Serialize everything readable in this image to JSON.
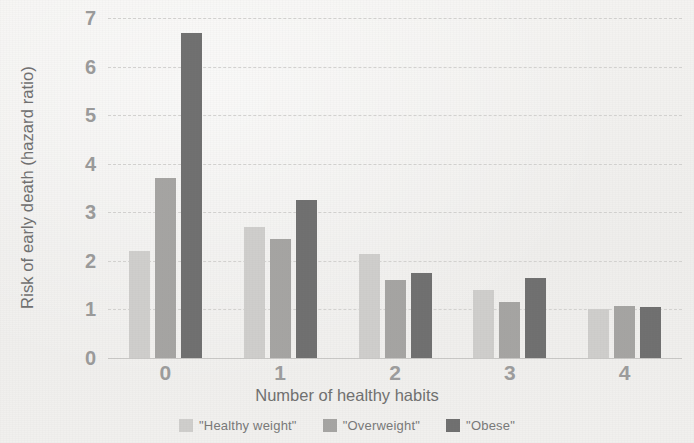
{
  "chart_data": {
    "type": "bar",
    "title": "",
    "xlabel": "Number of healthy habits",
    "ylabel": "Risk of early death (hazard ratio)",
    "categories": [
      "0",
      "1",
      "2",
      "3",
      "4"
    ],
    "series": [
      {
        "name": "\"Healthy weight\"",
        "color": "#cfcecc",
        "values": [
          2.2,
          2.7,
          2.15,
          1.4,
          1.0
        ]
      },
      {
        "name": "\"Overweight\"",
        "color": "#a5a4a2",
        "values": [
          3.7,
          2.45,
          1.6,
          1.15,
          1.07
        ]
      },
      {
        "name": "\"Obese\"",
        "color": "#6f6f6f",
        "values": [
          6.7,
          3.25,
          1.75,
          1.65,
          1.05
        ]
      }
    ],
    "ylim": [
      0,
      7
    ],
    "yticks": [
      "0",
      "1",
      "2",
      "3",
      "4",
      "5",
      "6",
      "7"
    ],
    "grid": true,
    "legend_position": "bottom"
  }
}
